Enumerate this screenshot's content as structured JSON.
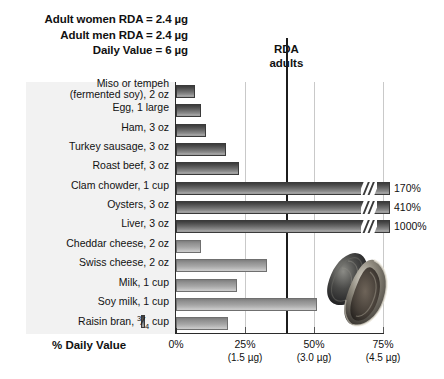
{
  "header": {
    "notes": [
      "Adult women RDA = 2.4 µg",
      "Adult men RDA = 2.4 µg",
      "Daily Value = 6 µg"
    ]
  },
  "annotation": {
    "rda_line_label_line1": "RDA",
    "rda_line_label_line2": "adults",
    "rda_line_percent": 40
  },
  "axis": {
    "title": "% Daily Value",
    "ticks": [
      {
        "percent": 0,
        "label": "0%",
        "sub": ""
      },
      {
        "percent": 25,
        "label": "25%",
        "sub": "(1.5 µg)"
      },
      {
        "percent": 50,
        "label": "50%",
        "sub": "(3.0 µg)"
      },
      {
        "percent": 75,
        "label": "75%",
        "sub": "(4.5 µg)"
      }
    ]
  },
  "images": {
    "oyster_photo": "oysters-photograph"
  },
  "colors": {
    "bar_dark_top": "#3b3b3b",
    "bar_dark_bottom": "#aeaeae",
    "bar_light_top": "#7d7d7d",
    "bar_light_bottom": "#cfcfcf",
    "label_panel_bg": "#f2f2f2",
    "gridline": "#c9c9c9",
    "axis": "#2b2b2b",
    "text": "#111111"
  },
  "chart_data": {
    "type": "bar",
    "orientation": "horizontal",
    "title": "",
    "subtitle": "",
    "xlabel": "% Daily Value",
    "ylabel": "",
    "xlim": [
      0,
      75
    ],
    "xticks": [
      0,
      25,
      50,
      75
    ],
    "xtick_labels": [
      "0%",
      "25%",
      "50%",
      "75%"
    ],
    "xtick_sublabels": [
      "",
      "(1.5 µg)",
      "(3.0 µg)",
      "(4.5 µg)"
    ],
    "grid": true,
    "legend": false,
    "nutrient": "Vitamin B12",
    "reference_lines": [
      {
        "label": "RDA adults",
        "value": 40,
        "unit": "% Daily Value"
      }
    ],
    "annotations": [
      "Adult women RDA = 2.4 µg",
      "Adult men RDA = 2.4 µg",
      "Daily Value = 6 µg"
    ],
    "categories": [
      "Miso or tempeh (fermented soy), 2 oz",
      "Egg, 1 large",
      "Ham, 3 oz",
      "Turkey sausage, 3 oz",
      "Roast beef, 3 oz",
      "Clam chowder, 1 cup",
      "Oysters, 3 oz",
      "Liver, 3 oz",
      "Cheddar cheese, 2 oz",
      "Swiss cheese, 2 oz",
      "Milk, 1 cup",
      "Soy milk, 1 cup",
      "Raisin bran, 3/4 cup"
    ],
    "values": [
      7,
      9,
      11,
      18,
      23,
      170,
      410,
      1000,
      9,
      33,
      22,
      51,
      19
    ],
    "bars": [
      {
        "label_line1": "Miso or tempeh",
        "label_line2": "(fermented soy), 2 oz",
        "value": 7,
        "value_label": "",
        "shade": "dark",
        "broken": false
      },
      {
        "label_line1": "Egg, 1 large",
        "label_line2": "",
        "value": 9,
        "value_label": "",
        "shade": "dark",
        "broken": false
      },
      {
        "label_line1": "Ham, 3 oz",
        "label_line2": "",
        "value": 11,
        "value_label": "",
        "shade": "dark",
        "broken": false
      },
      {
        "label_line1": "Turkey sausage, 3 oz",
        "label_line2": "",
        "value": 18,
        "value_label": "",
        "shade": "dark",
        "broken": false
      },
      {
        "label_line1": "Roast beef, 3 oz",
        "label_line2": "",
        "value": 23,
        "value_label": "",
        "shade": "dark",
        "broken": false
      },
      {
        "label_line1": "Clam chowder, 1 cup",
        "label_line2": "",
        "value": 170,
        "value_label": "170%",
        "shade": "dark",
        "broken": true
      },
      {
        "label_line1": "Oysters, 3 oz",
        "label_line2": "",
        "value": 410,
        "value_label": "410%",
        "shade": "dark",
        "broken": true
      },
      {
        "label_line1": "Liver, 3 oz",
        "label_line2": "",
        "value": 1000,
        "value_label": "1000%",
        "shade": "dark",
        "broken": true
      },
      {
        "label_line1": "Cheddar cheese, 2 oz",
        "label_line2": "",
        "value": 9,
        "value_label": "",
        "shade": "light",
        "broken": false
      },
      {
        "label_line1": "Swiss cheese, 2 oz",
        "label_line2": "",
        "value": 33,
        "value_label": "",
        "shade": "light",
        "broken": false
      },
      {
        "label_line1": "Milk, 1 cup",
        "label_line2": "",
        "value": 22,
        "value_label": "",
        "shade": "light",
        "broken": false
      },
      {
        "label_line1": "Soy milk, 1 cup",
        "label_line2": "",
        "value": 51,
        "value_label": "",
        "shade": "light",
        "broken": false
      },
      {
        "label_line1": "Raisin bran, ",
        "label_line2": " cup",
        "value": 19,
        "value_label": "",
        "shade": "light",
        "broken": false,
        "fraction": "3/4"
      }
    ]
  }
}
